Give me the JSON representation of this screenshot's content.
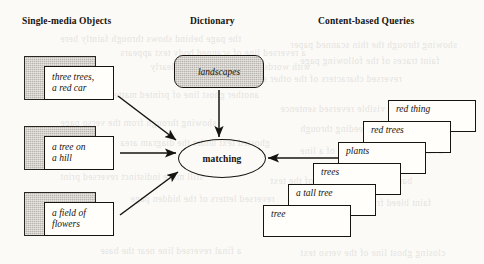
{
  "figure": {
    "type": "flow-diagram",
    "headings": [
      {
        "label": "Single-media Objects",
        "x": 22,
        "y": 16
      },
      {
        "label": "Dictionary",
        "x": 190,
        "y": 16
      },
      {
        "label": "Content-based Queries",
        "x": 318,
        "y": 16
      }
    ],
    "objects": [
      {
        "id": "obj-three-trees",
        "text": "three trees,\na red car",
        "shade": {
          "x": 24,
          "y": 56,
          "w": 72,
          "h": 44
        },
        "card": {
          "x": 44,
          "y": 66,
          "w": 70,
          "h": 34
        }
      },
      {
        "id": "obj-tree-hill",
        "text": "a tree on\na hill",
        "shade": {
          "x": 24,
          "y": 126,
          "w": 72,
          "h": 44
        },
        "card": {
          "x": 44,
          "y": 136,
          "w": 70,
          "h": 34
        }
      },
      {
        "id": "obj-field",
        "text": "a field of\nflowers",
        "shade": {
          "x": 24,
          "y": 192,
          "w": 72,
          "h": 44
        },
        "card": {
          "x": 44,
          "y": 202,
          "w": 70,
          "h": 34
        }
      }
    ],
    "dictionary": {
      "label": "landscapes"
    },
    "process": {
      "label": "matching"
    },
    "queries": [
      {
        "label": "red thing",
        "x": 388,
        "y": 100
      },
      {
        "label": "red trees",
        "x": 363,
        "y": 121
      },
      {
        "label": "plants",
        "x": 338,
        "y": 142
      },
      {
        "label": "trees",
        "x": 313,
        "y": 163
      },
      {
        "label": "a tall tree",
        "x": 288,
        "y": 184
      },
      {
        "label": "tree",
        "x": 263,
        "y": 205
      }
    ],
    "arrows": [
      {
        "id": "arrow-object-1-to-matching",
        "from": [
          118,
          96
        ],
        "to": [
          176,
          140
        ]
      },
      {
        "id": "arrow-object-2-to-matching",
        "from": [
          120,
          153
        ],
        "to": [
          176,
          153
        ]
      },
      {
        "id": "arrow-object-3-to-matching",
        "from": [
          120,
          215
        ],
        "to": [
          178,
          172
        ]
      },
      {
        "id": "arrow-dictionary-to-matching",
        "from": [
          219,
          90
        ],
        "to": [
          219,
          137
        ]
      },
      {
        "id": "arrow-queries-to-matching",
        "from": [
          352,
          158
        ],
        "to": [
          268,
          158
        ]
      }
    ],
    "colors": {
      "ink": "#15120d",
      "paper": "#fbfaf7",
      "shade_fill": "#b9b5ae",
      "card_fill": "#fffefb"
    },
    "bleed_lines": [
      {
        "text": "the page behind shows through faintly here",
        "x": 60,
        "y": 34
      },
      {
        "text": "a reversed line of scanned body text appears",
        "x": 120,
        "y": 48
      },
      {
        "text": "with words that cannot be read clearly",
        "x": 150,
        "y": 62
      },
      {
        "text": "showing through the thin scanned paper",
        "x": 290,
        "y": 40
      },
      {
        "text": "faint traces of the following page",
        "x": 300,
        "y": 56
      },
      {
        "text": "reversed characters of the other side",
        "x": 250,
        "y": 74
      },
      {
        "text": "another ghost line of printed matter",
        "x": 110,
        "y": 90
      },
      {
        "text": "partially visible reversed sentence",
        "x": 280,
        "y": 104
      },
      {
        "text": "showing through from the verso page",
        "x": 60,
        "y": 118
      },
      {
        "text": "more reversed words bleeding through",
        "x": 300,
        "y": 124
      },
      {
        "text": "ghosted text under the diagram area",
        "x": 120,
        "y": 138
      },
      {
        "text": "a faint reversed fragment of a line",
        "x": 300,
        "y": 146
      },
      {
        "text": "still more indistinct reversed print",
        "x": 60,
        "y": 172
      },
      {
        "text": "barely legible ghosting of the text",
        "x": 270,
        "y": 176
      },
      {
        "text": "reversed letters of the hidden page",
        "x": 130,
        "y": 194
      },
      {
        "text": "faint bleed from the opposite side",
        "x": 290,
        "y": 198
      },
      {
        "text": "a final reversed line near the base",
        "x": 100,
        "y": 246
      },
      {
        "text": "closing ghost line of the verso text",
        "x": 300,
        "y": 248
      }
    ]
  }
}
